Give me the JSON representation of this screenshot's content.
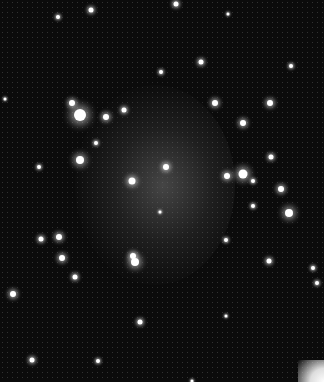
{
  "image": {
    "subject": "dwarf galaxy star field",
    "background_color": "#0b0b0b",
    "stars": [
      {
        "x": 80,
        "y": 115,
        "r": 6
      },
      {
        "x": 80,
        "y": 160,
        "r": 4
      },
      {
        "x": 106,
        "y": 117,
        "r": 3
      },
      {
        "x": 72,
        "y": 103,
        "r": 3
      },
      {
        "x": 132,
        "y": 181,
        "r": 3.5
      },
      {
        "x": 166,
        "y": 167,
        "r": 3
      },
      {
        "x": 243,
        "y": 174,
        "r": 4.5
      },
      {
        "x": 227,
        "y": 176,
        "r": 3
      },
      {
        "x": 289,
        "y": 213,
        "r": 4
      },
      {
        "x": 281,
        "y": 189,
        "r": 3
      },
      {
        "x": 135,
        "y": 262,
        "r": 4
      },
      {
        "x": 133,
        "y": 256,
        "r": 3
      },
      {
        "x": 59,
        "y": 237,
        "r": 3
      },
      {
        "x": 41,
        "y": 239,
        "r": 2.5
      },
      {
        "x": 62,
        "y": 258,
        "r": 3
      },
      {
        "x": 75,
        "y": 277,
        "r": 2.5
      },
      {
        "x": 13,
        "y": 294,
        "r": 3
      },
      {
        "x": 140,
        "y": 322,
        "r": 2.5
      },
      {
        "x": 32,
        "y": 360,
        "r": 2.5
      },
      {
        "x": 269,
        "y": 261,
        "r": 2.5
      },
      {
        "x": 317,
        "y": 283,
        "r": 2
      },
      {
        "x": 215,
        "y": 103,
        "r": 3
      },
      {
        "x": 270,
        "y": 103,
        "r": 3
      },
      {
        "x": 243,
        "y": 123,
        "r": 3
      },
      {
        "x": 271,
        "y": 157,
        "r": 2.5
      },
      {
        "x": 201,
        "y": 62,
        "r": 2.5
      },
      {
        "x": 161,
        "y": 72,
        "r": 2
      },
      {
        "x": 91,
        "y": 10,
        "r": 2.5
      },
      {
        "x": 58,
        "y": 17,
        "r": 2
      },
      {
        "x": 176,
        "y": 4,
        "r": 2.5
      },
      {
        "x": 291,
        "y": 66,
        "r": 2
      },
      {
        "x": 124,
        "y": 110,
        "r": 2.5
      },
      {
        "x": 96,
        "y": 143,
        "r": 2
      },
      {
        "x": 5,
        "y": 99,
        "r": 1.5
      },
      {
        "x": 253,
        "y": 181,
        "r": 2
      },
      {
        "x": 226,
        "y": 240,
        "r": 2
      },
      {
        "x": 253,
        "y": 206,
        "r": 2
      },
      {
        "x": 98,
        "y": 361,
        "r": 2
      },
      {
        "x": 226,
        "y": 316,
        "r": 1.5
      },
      {
        "x": 160,
        "y": 212,
        "r": 1.5
      },
      {
        "x": 192,
        "y": 381,
        "r": 1.5
      },
      {
        "x": 313,
        "y": 268,
        "r": 2
      },
      {
        "x": 39,
        "y": 167,
        "r": 2
      },
      {
        "x": 228,
        "y": 14,
        "r": 1.5
      }
    ],
    "corner_glow": "bottom-right"
  }
}
